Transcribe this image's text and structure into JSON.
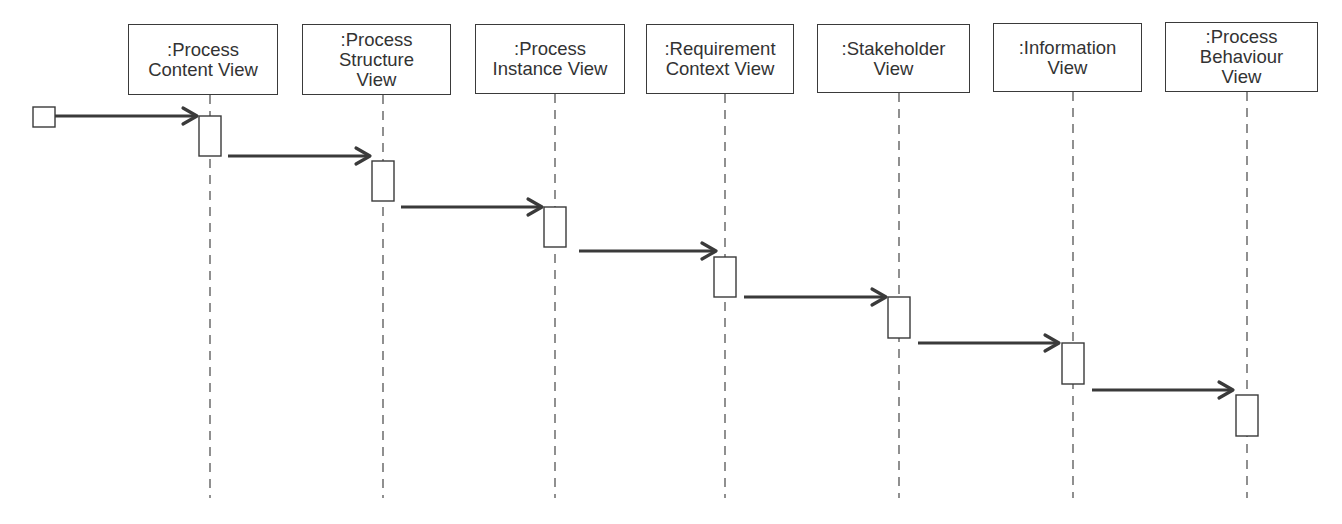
{
  "diagram": {
    "type": "UML sequence diagram",
    "colors": {
      "stroke": "#3a3a3a",
      "text": "#333333",
      "background": "#ffffff",
      "dash": "#555555"
    },
    "initial_node": {
      "x": 33,
      "y": 107,
      "w": 22,
      "h": 20
    },
    "lifelines": [
      {
        "id": "process-content-view",
        "label": ":Process\nContent View",
        "box": {
          "x": 128,
          "y": 24,
          "w": 150,
          "h": 71
        },
        "cx": 210,
        "activation": {
          "y": 116,
          "h": 40
        }
      },
      {
        "id": "process-structure-view",
        "label": ":Process\nStructure\nView",
        "box": {
          "x": 302,
          "y": 24,
          "w": 149,
          "h": 71
        },
        "cx": 383,
        "activation": {
          "y": 161,
          "h": 40
        }
      },
      {
        "id": "process-instance-view",
        "label": ":Process\nInstance View",
        "box": {
          "x": 475,
          "y": 24,
          "w": 150,
          "h": 70
        },
        "cx": 555,
        "activation": {
          "y": 207,
          "h": 40
        }
      },
      {
        "id": "requirement-context-view",
        "label": ":Requirement\nContext View",
        "box": {
          "x": 646,
          "y": 24,
          "w": 148,
          "h": 70
        },
        "cx": 725,
        "activation": {
          "y": 257,
          "h": 40
        }
      },
      {
        "id": "stakeholder-view",
        "label": ":Stakeholder\nView",
        "box": {
          "x": 817,
          "y": 24,
          "w": 153,
          "h": 69
        },
        "cx": 899,
        "activation": {
          "y": 297,
          "h": 41
        }
      },
      {
        "id": "information-view",
        "label": ":Information\nView",
        "box": {
          "x": 993,
          "y": 23,
          "w": 149,
          "h": 69
        },
        "cx": 1073,
        "activation": {
          "y": 343,
          "h": 41
        }
      },
      {
        "id": "process-behaviour-view",
        "label": ":Process\nBehaviour\nView",
        "box": {
          "x": 1165,
          "y": 22,
          "w": 153,
          "h": 70
        },
        "cx": 1247,
        "activation": {
          "y": 395,
          "h": 41
        }
      }
    ],
    "lifeline_end_y": 498,
    "messages": [
      {
        "from": "initial",
        "to": "process-content-view",
        "x1": 55,
        "x2": 197,
        "y": 116
      },
      {
        "from": "process-content-view",
        "to": "process-structure-view",
        "x1": 228,
        "x2": 370,
        "y": 156
      },
      {
        "from": "process-structure-view",
        "to": "process-instance-view",
        "x1": 401,
        "x2": 542,
        "y": 207
      },
      {
        "from": "process-instance-view",
        "to": "requirement-context-view",
        "x1": 579,
        "x2": 716,
        "y": 251
      },
      {
        "from": "requirement-context-view",
        "to": "stakeholder-view",
        "x1": 744,
        "x2": 886,
        "y": 297
      },
      {
        "from": "stakeholder-view",
        "to": "information-view",
        "x1": 918,
        "x2": 1059,
        "y": 343
      },
      {
        "from": "information-view",
        "to": "process-behaviour-view",
        "x1": 1092,
        "x2": 1233,
        "y": 390
      }
    ],
    "activation_width": 22
  }
}
